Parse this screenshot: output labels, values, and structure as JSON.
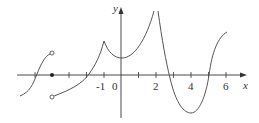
{
  "figure": {
    "type": "function-graph",
    "axes": {
      "x_label": "x",
      "y_label": "y",
      "origin_label": "0",
      "x_tick_labels": [
        "-1",
        "2",
        "4",
        "6"
      ],
      "x_ticks": [
        -5,
        -4,
        -3,
        -2,
        -1,
        0,
        1,
        2,
        3,
        4,
        5,
        6
      ]
    },
    "colors": {
      "curve": "#555555",
      "axis": "#333333",
      "background": "#ffffff"
    },
    "features": {
      "open_circles": [
        [
          -4,
          1.25
        ],
        [
          -4,
          -1.25
        ]
      ],
      "solid_dot_on_axis": [
        -4,
        0
      ],
      "cusp": [
        -1,
        1.9
      ],
      "vertical_asymptote_near": 2,
      "local_min": [
        4,
        -2.2
      ]
    }
  }
}
